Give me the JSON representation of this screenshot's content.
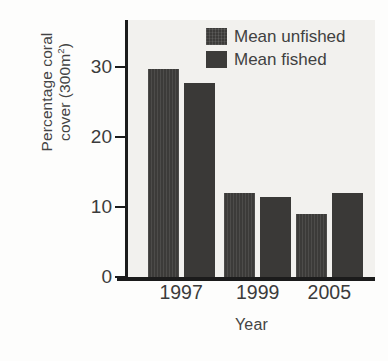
{
  "chart_data": {
    "type": "bar",
    "title": "",
    "xlabel": "Year",
    "ylabel_line1": "Percentage coral",
    "ylabel_line2_pre": "cover (300m",
    "ylabel_line2_sup": "2",
    "ylabel_line2_post": ")",
    "ylabel": "Percentage coral cover (300m2)",
    "categories": [
      "1997",
      "1999",
      "2005"
    ],
    "series": [
      {
        "name": "Mean unfished",
        "values": [
          29.7,
          12.0,
          9.0
        ],
        "color": "#3c3b39",
        "fill": "hatched"
      },
      {
        "name": "Mean fished",
        "values": [
          27.7,
          11.4,
          12.0
        ],
        "color": "#3a3937",
        "fill": "solid"
      }
    ],
    "ylim": [
      0,
      36.7
    ],
    "yticks": [
      0,
      10,
      20,
      30
    ],
    "ytick_labels": [
      "0",
      "10",
      "20",
      "30"
    ],
    "grid": false,
    "legend_position": "top-right",
    "plot_background": "#f2f1ee",
    "axis_color": "#1b1b1b"
  },
  "legend": {
    "entries": [
      {
        "label": "Mean unfished"
      },
      {
        "label": "Mean fished"
      }
    ]
  }
}
